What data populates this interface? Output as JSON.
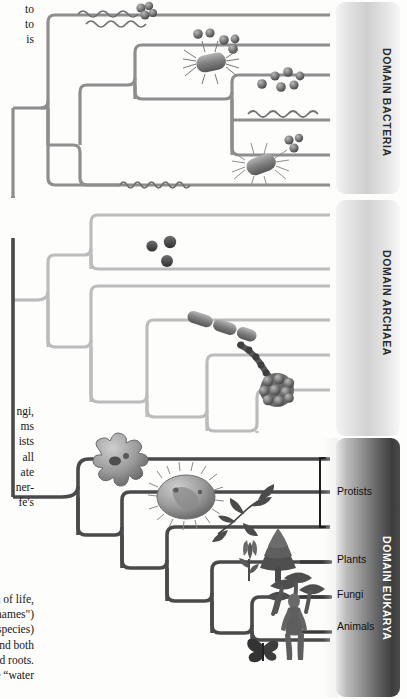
{
  "figure": {
    "root_label": "",
    "colors": {
      "bacteria_branch": "#8e8e8e",
      "archaea_branch": "#b9b9b9",
      "eukarya_branch": "#4a4a4a",
      "root_branch": "#9a9a9a",
      "bracket": "#1d1d1d",
      "panel_eukarya_text": "#ffffff",
      "panel_light_text": "#2a2a2a"
    }
  },
  "body_text": {
    "top_fragment": "to\nto\nis",
    "middle_fragment": "ngi,\nms\nists\nall\nate\nner-\nfe's",
    "bottom_fragment": "n of life,\nnames\")\nspecies)\nnd both\nrd roots.\ne “water"
  },
  "domains": [
    {
      "id": "bacteria",
      "label": "DOMAIN BACTERIA",
      "panel": {
        "top": 2,
        "height": 192,
        "tone": "light"
      },
      "tips": [
        {
          "id": "bact-tip-1",
          "y": 15,
          "organism": "spirochete-and-cocci-cluster"
        },
        {
          "id": "bact-tip-2",
          "y": 51,
          "organism": "cocci-and-flagellated-bacillus"
        },
        {
          "id": "bact-tip-3",
          "y": 82,
          "organism": "cocci-cluster"
        },
        {
          "id": "bact-tip-4",
          "y": 114,
          "organism": "spirochete"
        },
        {
          "id": "bact-tip-5",
          "y": 146,
          "organism": "flagellated-bacillus-with-cocci"
        },
        {
          "id": "bact-tip-6",
          "y": 184,
          "organism": "spirochete-long"
        }
      ]
    },
    {
      "id": "archaea",
      "label": "DOMAIN ARCHAEA",
      "panel": {
        "top": 200,
        "height": 236,
        "tone": "light"
      },
      "tips": [
        {
          "id": "arch-tip-1",
          "y": 215,
          "organism": ""
        },
        {
          "id": "arch-tip-2",
          "y": 251,
          "organism": "archaeal-cocci"
        },
        {
          "id": "arch-tip-3",
          "y": 286,
          "organism": ""
        },
        {
          "id": "arch-tip-4",
          "y": 320,
          "organism": "rod-chain"
        },
        {
          "id": "arch-tip-5",
          "y": 355,
          "organism": "bead-chain"
        },
        {
          "id": "arch-tip-6",
          "y": 390,
          "organism": "berry-cluster"
        }
      ]
    },
    {
      "id": "eukarya",
      "label": "DOMAIN EUKARYA",
      "panel": {
        "top": 438,
        "height": 259,
        "tone": "dark"
      },
      "tips": [
        {
          "id": "euk-tip-1",
          "y": 459,
          "organism": "amoeba",
          "group": "Protists"
        },
        {
          "id": "euk-tip-2",
          "y": 492,
          "organism": "ciliate",
          "group": "Protists"
        },
        {
          "id": "euk-tip-3",
          "y": 527,
          "organism": "algae-frond",
          "group": "Protists"
        },
        {
          "id": "euk-tip-4",
          "y": 562,
          "organism": "plants",
          "group": "Plants"
        },
        {
          "id": "euk-tip-5",
          "y": 597,
          "organism": "mushrooms",
          "group": "Fungi"
        },
        {
          "id": "euk-tip-6",
          "y": 632,
          "organism": "human-and-butterfly",
          "group": "Animals"
        }
      ],
      "group_labels": [
        {
          "id": "protists",
          "text": "Protists",
          "bracketed": true
        },
        {
          "id": "plants",
          "text": "Plants",
          "bracketed": false
        },
        {
          "id": "fungi",
          "text": "Fungi",
          "bracketed": false
        },
        {
          "id": "animals",
          "text": "Animals",
          "bracketed": false
        }
      ]
    }
  ]
}
